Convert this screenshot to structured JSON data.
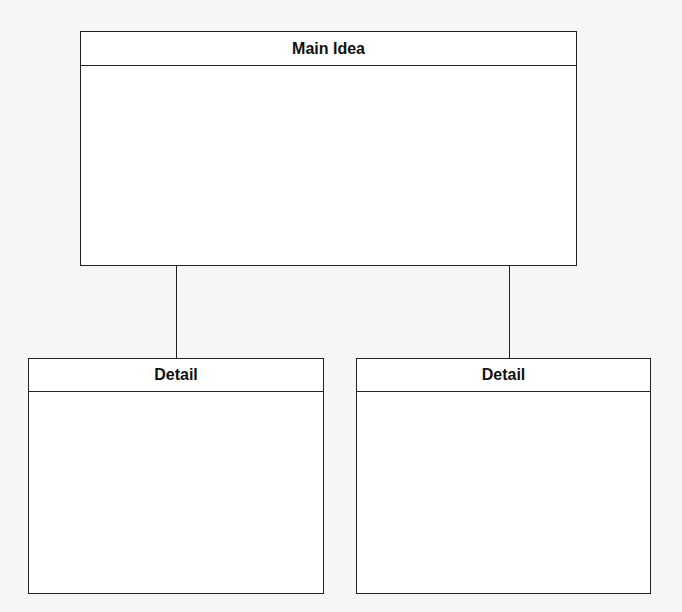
{
  "diagram": {
    "main": {
      "title": "Main Idea",
      "content": ""
    },
    "details": [
      {
        "title": "Detail",
        "content": ""
      },
      {
        "title": "Detail",
        "content": ""
      }
    ]
  },
  "colors": {
    "line": "#222222",
    "box_fill": "#ffffff",
    "background": "#f6f6f5"
  }
}
